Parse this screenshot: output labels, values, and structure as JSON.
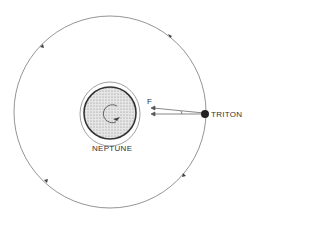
{
  "diagram": {
    "labels": {
      "planet": "NEPTUNE",
      "moon": "TRITON",
      "force": "F"
    },
    "colors": {
      "line": "#555555",
      "planet_fill": "#c8c8c8",
      "moon": "#222222"
    }
  }
}
